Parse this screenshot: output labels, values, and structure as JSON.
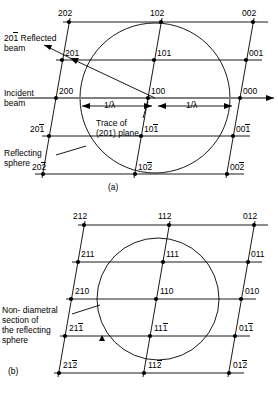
{
  "figure": {
    "type": "reciprocal-lattice-ewald-sphere-diagram",
    "panels": [
      {
        "id": "a",
        "caption": "(a)",
        "annotations": {
          "reflected_beam": "201 Reflected\nbeam",
          "reflected_beam_line1_idx": "201",
          "reflected_beam_line1_bar": "1",
          "reflected_beam_line1_text": " Reflected",
          "reflected_beam_line2": "beam",
          "incident_beam_line1": "Incident",
          "incident_beam_line2": "beam",
          "reflecting_sphere_line1": "Reflecting",
          "reflecting_sphere_line2": "sphere",
          "trace_line1": "Trace of",
          "trace_line2": "(201) plane",
          "radius_left": "1/λ",
          "radius_right": "1/λ"
        },
        "rows": [
          {
            "points": [
              {
                "text": "202",
                "bar": "none"
              },
              {
                "text": "102",
                "bar": "none"
              },
              {
                "text": "002",
                "bar": "none"
              }
            ]
          },
          {
            "points": [
              {
                "text": "201",
                "bar": "none"
              },
              {
                "text": "101",
                "bar": "none"
              },
              {
                "text": "001",
                "bar": "none"
              }
            ]
          },
          {
            "points": [
              {
                "text": "200",
                "bar": "none"
              },
              {
                "text": "100",
                "bar": "none"
              },
              {
                "text": "000",
                "bar": "none"
              }
            ]
          },
          {
            "points": [
              {
                "text": "201",
                "bar": "last"
              },
              {
                "text": "101",
                "bar": "last"
              },
              {
                "text": "001",
                "bar": "last"
              }
            ]
          },
          {
            "points": [
              {
                "text": "202",
                "bar": "last"
              },
              {
                "text": "102",
                "bar": "last"
              },
              {
                "text": "002",
                "bar": "last"
              }
            ]
          }
        ]
      },
      {
        "id": "b",
        "caption": "(b)",
        "annotations": {
          "non_diametral_line1": "Non- diametral",
          "non_diametral_line2": "section of",
          "non_diametral_line3": "the reflecting",
          "non_diametral_line4": "sphere"
        },
        "rows": [
          {
            "points": [
              {
                "text": "212",
                "bar": "none"
              },
              {
                "text": "112",
                "bar": "none"
              },
              {
                "text": "012",
                "bar": "none"
              }
            ]
          },
          {
            "points": [
              {
                "text": "211",
                "bar": "none"
              },
              {
                "text": "111",
                "bar": "none"
              },
              {
                "text": "011",
                "bar": "none"
              }
            ]
          },
          {
            "points": [
              {
                "text": "210",
                "bar": "none"
              },
              {
                "text": "110",
                "bar": "none"
              },
              {
                "text": "010",
                "bar": "none"
              }
            ]
          },
          {
            "points": [
              {
                "text": "211",
                "bar": "last"
              },
              {
                "text": "111",
                "bar": "last"
              },
              {
                "text": "011",
                "bar": "last"
              }
            ]
          },
          {
            "points": [
              {
                "text": "212",
                "bar": "last"
              },
              {
                "text": "112",
                "bar": "last"
              },
              {
                "text": "012",
                "bar": "last"
              }
            ]
          }
        ]
      }
    ],
    "colors": {
      "line": "#000000",
      "background": "#ffffff",
      "beam": "#888888"
    }
  }
}
